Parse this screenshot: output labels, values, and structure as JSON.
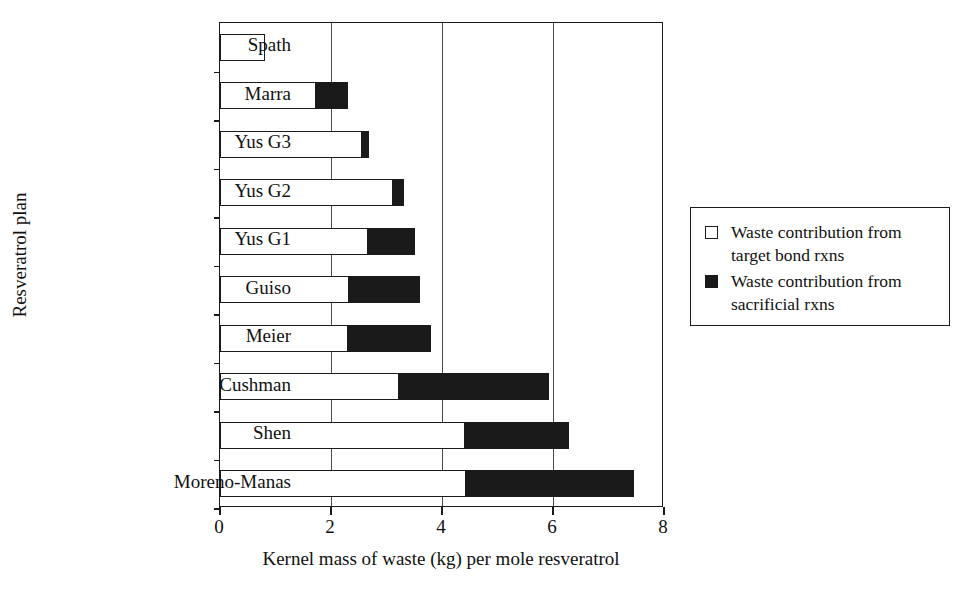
{
  "chart_data": {
    "type": "bar",
    "orientation": "horizontal",
    "stacked": true,
    "title": "",
    "xlabel": "Kernel mass of waste (kg) per mole resveratrol",
    "ylabel": "Resveratrol plan",
    "xlim": [
      0,
      8
    ],
    "xticks": [
      0,
      2,
      4,
      6,
      8
    ],
    "xtick_labels": [
      "0",
      "2",
      "4",
      "6",
      "8"
    ],
    "grid": "vertical",
    "legend_position": "right-outside",
    "categories": [
      "Spath",
      "Marra",
      "Yus G3",
      "Yus G2",
      "Yus G1",
      "Guiso",
      "Meier",
      "Cushman",
      "Shen",
      "Moreno-Manas"
    ],
    "series": [
      {
        "name": "Waste contribution from target bond rxns",
        "color": "#ffffff",
        "edge_color": "#1a1a1a",
        "values": [
          0.81,
          1.73,
          2.56,
          3.12,
          2.67,
          2.33,
          2.31,
          3.23,
          4.42,
          4.44
        ]
      },
      {
        "name": "Waste contribution from sacrificial rxns",
        "color": "#1a1a1a",
        "edge_color": "#1a1a1a",
        "values": [
          0.0,
          0.58,
          0.13,
          0.2,
          0.85,
          1.28,
          1.5,
          2.69,
          1.86,
          3.02
        ]
      }
    ],
    "totals": [
      0.81,
      2.31,
      2.69,
      3.32,
      3.52,
      3.61,
      3.81,
      5.92,
      6.28,
      7.46
    ]
  },
  "legend": {
    "entries": [
      {
        "swatch": "hollow-square-icon",
        "label": "Waste contribution from target bond rxns"
      },
      {
        "swatch": "filled-square-icon",
        "label": "Waste contribution from sacrificial rxns"
      }
    ]
  }
}
